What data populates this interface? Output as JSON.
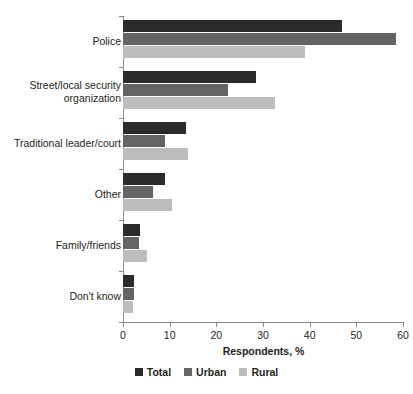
{
  "chart_data": {
    "type": "bar",
    "orientation": "horizontal",
    "title": "",
    "xlabel": "Respondents, %",
    "ylabel": "",
    "xlim": [
      0,
      60
    ],
    "xticks": [
      0,
      10,
      20,
      30,
      40,
      50,
      60
    ],
    "grid": false,
    "legend_position": "bottom",
    "categories": [
      "Police",
      "Street/local security organization",
      "Traditional leader/court",
      "Other",
      "Family/friends",
      "Don't know"
    ],
    "series": [
      {
        "name": "Total",
        "color": "#2b2b2b",
        "values": [
          47,
          28.5,
          13.5,
          9,
          3.7,
          2.4
        ]
      },
      {
        "name": "Urban",
        "color": "#646464",
        "values": [
          58.5,
          22.5,
          9,
          6.5,
          3.5,
          2.4
        ]
      },
      {
        "name": "Rural",
        "color": "#bcbcbc",
        "values": [
          39,
          32.5,
          14,
          10.5,
          5.1,
          2.1
        ]
      }
    ]
  },
  "axis": {
    "x_title": "Respondents, %",
    "tick_labels": [
      "0",
      "10",
      "20",
      "30",
      "40",
      "50",
      "60"
    ]
  },
  "categories": [
    {
      "label_line1": "Police",
      "label_line2": ""
    },
    {
      "label_line1": "Street/local security",
      "label_line2": "organization"
    },
    {
      "label_line1": "Traditional leader/court",
      "label_line2": ""
    },
    {
      "label_line1": "Other",
      "label_line2": ""
    },
    {
      "label_line1": "Family/friends",
      "label_line2": ""
    },
    {
      "label_line1": "Don't know",
      "label_line2": ""
    }
  ],
  "legend": {
    "items": [
      {
        "label": "Total",
        "color": "#2b2b2b"
      },
      {
        "label": "Urban",
        "color": "#646464"
      },
      {
        "label": "Rural",
        "color": "#bcbcbc"
      }
    ]
  }
}
